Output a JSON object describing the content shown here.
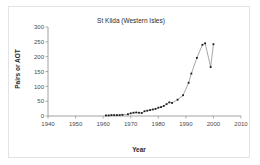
{
  "chart_data": {
    "type": "line",
    "title": "St Kilda (Western Isles)",
    "xlabel": "Year",
    "ylabel": "Pairs or AOT",
    "xlim": [
      1940,
      2010
    ],
    "ylim": [
      0,
      300
    ],
    "xticks": [
      1940,
      1950,
      1960,
      1970,
      1980,
      1990,
      2000,
      2010
    ],
    "yticks": [
      0,
      50,
      100,
      150,
      200,
      250,
      300
    ],
    "grid": false,
    "legend": "none",
    "marker": "filled-square",
    "series": [
      {
        "name": "St Kilda",
        "x": [
          1961,
          1962,
          1963,
          1964,
          1965,
          1966,
          1967,
          1969,
          1970,
          1971,
          1972,
          1973,
          1974,
          1975,
          1976,
          1977,
          1978,
          1979,
          1980,
          1981,
          1982,
          1983,
          1984,
          1985,
          1987,
          1989,
          1991,
          1992,
          1994,
          1996,
          1997,
          1999,
          2000
        ],
        "y": [
          2,
          2,
          3,
          3,
          3,
          3,
          4,
          6,
          9,
          11,
          12,
          11,
          10,
          16,
          18,
          20,
          22,
          24,
          28,
          30,
          34,
          40,
          46,
          44,
          55,
          70,
          112,
          143,
          196,
          240,
          245,
          165,
          242
        ]
      }
    ]
  }
}
